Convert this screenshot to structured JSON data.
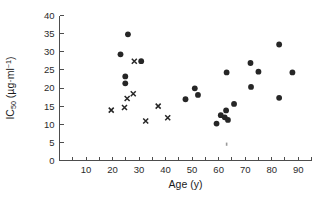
{
  "chart_data": {
    "type": "scatter",
    "title": "",
    "xlabel": "Age (y)",
    "ylabel": "IC50 (µg·ml-1)",
    "ylabel_parts": {
      "base": "IC",
      "subscript": "50",
      "units_open": " (µg·ml",
      "superscript": "−1",
      "units_close": ")"
    },
    "xlim": [
      0,
      95
    ],
    "ylim": [
      0,
      40
    ],
    "xticks": [
      0,
      5,
      10,
      15,
      20,
      25,
      30,
      35,
      40,
      45,
      50,
      55,
      60,
      65,
      70,
      75,
      80,
      85,
      90,
      95
    ],
    "xtick_labels_shown": [
      10,
      20,
      30,
      40,
      50,
      60,
      70,
      80,
      90
    ],
    "yticks": [
      0,
      5,
      10,
      15,
      20,
      25,
      30,
      35,
      40
    ],
    "ytick_labels_shown": [
      0,
      5,
      10,
      15,
      20,
      25,
      30,
      35,
      40
    ],
    "grid": false,
    "legend": false,
    "legend_position": "none",
    "marker_color": "#262626",
    "axis_color": "#4d4d4d",
    "series": [
      {
        "name": "filled-circle",
        "marker": "circle",
        "points": [
          [
            23.0,
            29.3
          ],
          [
            24.8,
            23.2
          ],
          [
            24.8,
            21.3
          ],
          [
            25.8,
            34.8
          ],
          [
            30.8,
            27.4
          ],
          [
            47.5,
            16.9
          ],
          [
            51.0,
            19.9
          ],
          [
            52.2,
            18.1
          ],
          [
            59.2,
            10.2
          ],
          [
            60.8,
            12.5
          ],
          [
            62.3,
            11.9
          ],
          [
            62.8,
            13.8
          ],
          [
            63.5,
            11.2
          ],
          [
            63.0,
            24.3
          ],
          [
            65.8,
            15.6
          ],
          [
            72.0,
            26.9
          ],
          [
            72.2,
            20.3
          ],
          [
            75.0,
            24.5
          ],
          [
            82.8,
            32.0
          ],
          [
            82.8,
            17.3
          ],
          [
            87.8,
            24.3
          ]
        ]
      },
      {
        "name": "cross",
        "marker": "x",
        "points": [
          [
            19.5,
            13.9
          ],
          [
            24.5,
            14.6
          ],
          [
            25.5,
            17.1
          ],
          [
            27.8,
            18.4
          ],
          [
            28.2,
            27.4
          ],
          [
            32.5,
            10.9
          ],
          [
            37.2,
            15.0
          ],
          [
            40.8,
            11.8
          ]
        ]
      }
    ],
    "artifact_marks": [
      [
        63.0,
        4.5
      ]
    ]
  }
}
